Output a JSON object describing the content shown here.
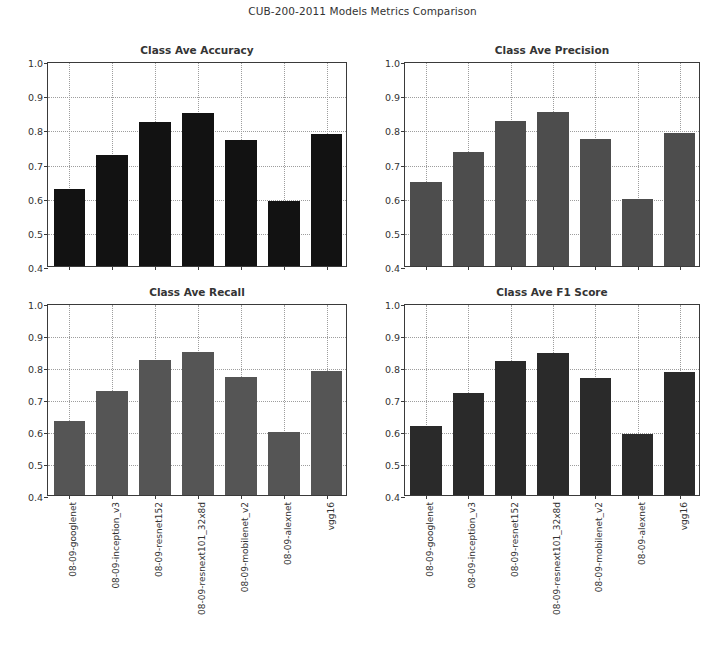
{
  "figure": {
    "title": "CUB-200-2011 Models Metrics Comparison",
    "width": 725,
    "height": 658,
    "background": "#ffffff"
  },
  "axis": {
    "ylim": [
      0.4,
      1.0
    ],
    "yticks": [
      "1.0",
      "0.9",
      "0.8",
      "0.7",
      "0.6",
      "0.5",
      "0.4"
    ],
    "ytick_values": [
      1.0,
      0.9,
      0.8,
      0.7,
      0.6,
      0.5,
      0.4
    ],
    "grid": true,
    "grid_color": "#9d9d9d",
    "spine_color": "#3a3a3a"
  },
  "models": [
    "08-09-googlenet",
    "08-09-inception_v3",
    "08-09-resnet152",
    "08-09-resnext101_32x8d",
    "08-09-mobilenet_v2",
    "08-09-alexnet",
    "vgg16"
  ],
  "chart_data": [
    {
      "type": "bar",
      "title": "Class Ave Accuracy",
      "xlabel": "",
      "ylabel": "",
      "ylim": [
        0.4,
        1.0
      ],
      "grid": true,
      "legend": "none",
      "bar_color": "#121212",
      "categories": [
        "08-09-googlenet",
        "08-09-inception_v3",
        "08-09-resnet152",
        "08-09-resnext101_32x8d",
        "08-09-mobilenet_v2",
        "08-09-alexnet",
        "vgg16"
      ],
      "values": [
        0.625,
        0.725,
        0.822,
        0.848,
        0.768,
        0.59,
        0.785
      ]
    },
    {
      "type": "bar",
      "title": "Class Ave Precision",
      "xlabel": "",
      "ylabel": "",
      "ylim": [
        0.4,
        1.0
      ],
      "grid": true,
      "legend": "none",
      "bar_color": "#4d4d4d",
      "categories": [
        "08-09-googlenet",
        "08-09-inception_v3",
        "08-09-resnet152",
        "08-09-resnext101_32x8d",
        "08-09-mobilenet_v2",
        "08-09-alexnet",
        "vgg16"
      ],
      "values": [
        0.645,
        0.735,
        0.825,
        0.85,
        0.772,
        0.595,
        0.79
      ]
    },
    {
      "type": "bar",
      "title": "Class Ave Recall",
      "xlabel": "",
      "ylabel": "",
      "ylim": [
        0.4,
        1.0
      ],
      "grid": true,
      "legend": "none",
      "bar_color": "#555555",
      "categories": [
        "08-09-googlenet",
        "08-09-inception_v3",
        "08-09-resnet152",
        "08-09-resnext101_32x8d",
        "08-09-mobilenet_v2",
        "08-09-alexnet",
        "vgg16"
      ],
      "values": [
        0.632,
        0.726,
        0.821,
        0.848,
        0.769,
        0.596,
        0.787
      ]
    },
    {
      "type": "bar",
      "title": "Class Ave F1 Score",
      "xlabel": "",
      "ylabel": "",
      "ylim": [
        0.4,
        1.0
      ],
      "grid": true,
      "legend": "none",
      "bar_color": "#2a2a2a",
      "categories": [
        "08-09-googlenet",
        "08-09-inception_v3",
        "08-09-resnet152",
        "08-09-resnext101_32x8d",
        "08-09-mobilenet_v2",
        "08-09-alexnet",
        "vgg16"
      ],
      "values": [
        0.615,
        0.718,
        0.818,
        0.845,
        0.767,
        0.592,
        0.785
      ]
    }
  ],
  "layout": {
    "subplots": [
      {
        "axes_left": 47,
        "axes_top": 62,
        "axes_width": 300,
        "axes_height": 205,
        "title_top": 44,
        "show_xticklabels": false
      },
      {
        "axes_left": 404,
        "axes_top": 62,
        "axes_width": 296,
        "axes_height": 205,
        "title_top": 44,
        "show_xticklabels": false
      },
      {
        "axes_left": 47,
        "axes_top": 304,
        "axes_width": 300,
        "axes_height": 192,
        "title_top": 286,
        "show_xticklabels": true
      },
      {
        "axes_left": 404,
        "axes_top": 304,
        "axes_width": 296,
        "axes_height": 192,
        "title_top": 286,
        "show_xticklabels": true
      }
    ]
  }
}
